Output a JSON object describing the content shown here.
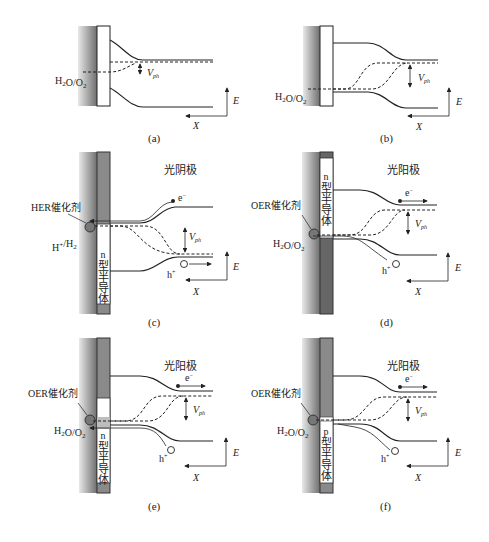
{
  "figure": {
    "panels": [
      {
        "id": "a",
        "caption": "(a)",
        "redox_label": "H2O/O2",
        "vph_label": "V",
        "vph_sub": "ph"
      },
      {
        "id": "b",
        "caption": "(b)",
        "redox_label": "H2O/O2",
        "vph_label": "V",
        "vph_sub": "ph"
      },
      {
        "id": "c",
        "caption": "(c)",
        "title": "光阴极",
        "catalyst_label": "HER催化剂",
        "redox_label": "H+/H2",
        "semiconductor_label": [
          "n",
          "型",
          "半",
          "导",
          "体"
        ],
        "electron_label": "e",
        "hole_label": "h",
        "vph_label": "V",
        "vph_sub": "ph"
      },
      {
        "id": "d",
        "caption": "(d)",
        "title": "光阳极",
        "catalyst_label": "OER催化剂",
        "redox_label": "H2O/O2",
        "semiconductor_label": [
          "n",
          "型",
          "半",
          "导",
          "体"
        ],
        "electron_label": "e",
        "hole_label": "h",
        "vph_label": "V",
        "vph_sub": "ph"
      },
      {
        "id": "e",
        "caption": "(e)",
        "title": "光阳极",
        "catalyst_label": "OER催化剂",
        "redox_label": "H2O/O2",
        "semiconductor_label": [
          "n",
          "型",
          "半",
          "导",
          "体"
        ],
        "electron_label": "e",
        "hole_label": "h",
        "vph_label": "V",
        "vph_sub": "ph"
      },
      {
        "id": "f",
        "caption": "(f)",
        "title": "光阳极",
        "catalyst_label": "OER催化剂",
        "redox_label": "H2O/O2",
        "semiconductor_label": [
          "p",
          "型",
          "半",
          "导",
          "体"
        ],
        "electron_label": "e",
        "hole_label": "h",
        "vph_label": "V",
        "vph_sub": "ph"
      }
    ],
    "axes": {
      "energy": "E",
      "position": "X"
    },
    "colors": {
      "line": "#222222",
      "electrode_dark": "#666666",
      "electrode_mid": "#8a8a8a",
      "bg_gradient_dark": "#7a7a7a"
    }
  }
}
